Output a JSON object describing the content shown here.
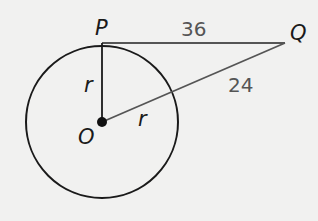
{
  "diagram": {
    "points": {
      "P": "P",
      "Q": "Q",
      "O": "O"
    },
    "labels": {
      "PQ": "36",
      "outside_segment": "24",
      "radius_vertical": "r",
      "radius_slanted": "r"
    },
    "colors": {
      "stroke": "#1a1a1a",
      "segment": "#555555",
      "background": "#f1f1f0"
    }
  }
}
